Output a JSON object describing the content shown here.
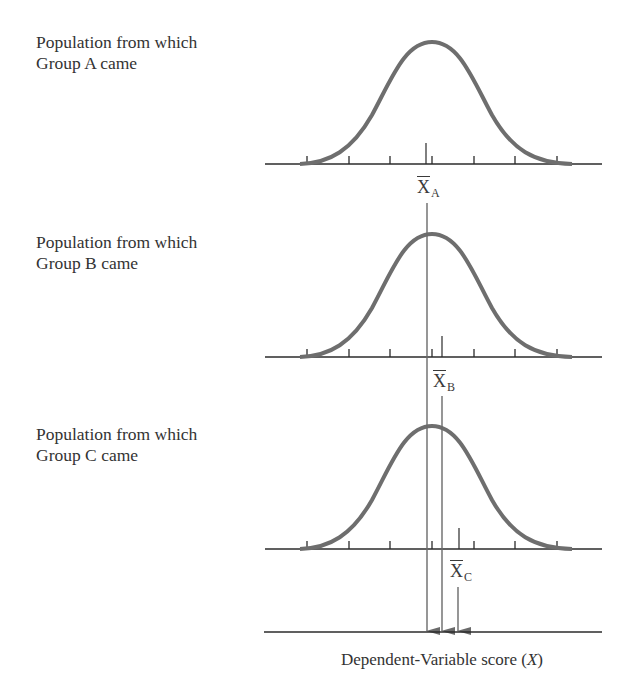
{
  "groups": [
    {
      "id": "A",
      "label_line1": "Population from which",
      "label_line2": "Group A came",
      "mean_symbol": "X",
      "mean_subscript": "A",
      "mean_position_px": 427
    },
    {
      "id": "B",
      "label_line1": "Population from which",
      "label_line2": "Group B came",
      "mean_symbol": "X",
      "mean_subscript": "B",
      "mean_position_px": 442
    },
    {
      "id": "C",
      "label_line1": "Population from which",
      "label_line2": "Group C came",
      "mean_symbol": "X",
      "mean_subscript": "C",
      "mean_position_px": 459
    }
  ],
  "axis": {
    "title_prefix": "Dependent-Variable score (",
    "title_var": "X",
    "title_suffix": ")"
  },
  "colors": {
    "curve": "#6e6e6e",
    "axis": "#2b2b2b",
    "arrow": "#6a6a6a",
    "text": "#333333"
  }
}
